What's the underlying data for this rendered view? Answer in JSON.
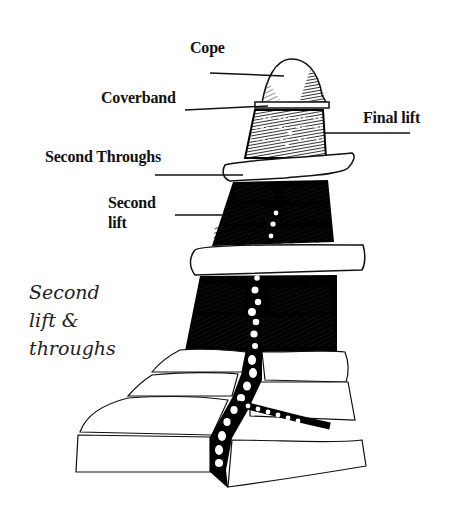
{
  "diagram": {
    "labels": [
      {
        "id": "cope",
        "text": "Cope"
      },
      {
        "id": "coverband",
        "text": "Coverband"
      },
      {
        "id": "final-lift",
        "text": "Final lift"
      },
      {
        "id": "second-throughs",
        "text": "Second Throughs"
      },
      {
        "id": "second-lift",
        "text": "Second\nlift"
      }
    ],
    "caption": "Second\nlift &\nthroughs",
    "colors": {
      "ink": "#111111",
      "paper": "#ffffff"
    }
  }
}
